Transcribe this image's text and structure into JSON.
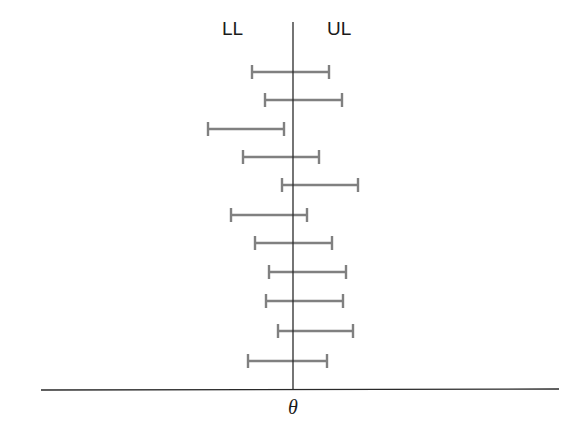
{
  "figure": {
    "labels": {
      "lower_limit": "LL",
      "upper_limit": "UL",
      "parameter": "θ"
    },
    "colors": {
      "axis": "#2a2a2a",
      "interval": "#808080",
      "text": "#1a1a1a"
    },
    "axes": {
      "horizontal": {
        "x1": 41,
        "y1": 390,
        "x2": 559,
        "y2": 389
      },
      "vertical": {
        "x": 293,
        "y1": 22,
        "y2": 390
      }
    },
    "intervals": [
      {
        "lower": 252,
        "upper": 329,
        "y": 72
      },
      {
        "lower": 265,
        "upper": 342,
        "y": 100
      },
      {
        "lower": 208,
        "upper": 284,
        "y": 129
      },
      {
        "lower": 243,
        "upper": 319,
        "y": 157
      },
      {
        "lower": 282,
        "upper": 358,
        "y": 185
      },
      {
        "lower": 231,
        "upper": 307,
        "y": 215
      },
      {
        "lower": 255,
        "upper": 332,
        "y": 243
      },
      {
        "lower": 269,
        "upper": 346,
        "y": 272
      },
      {
        "lower": 266,
        "upper": 343,
        "y": 301
      },
      {
        "lower": 278,
        "upper": 353,
        "y": 331
      },
      {
        "lower": 248,
        "upper": 327,
        "y": 361
      }
    ]
  }
}
